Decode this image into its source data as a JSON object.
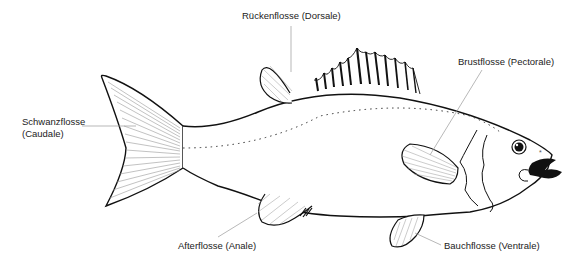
{
  "diagram": {
    "labels": {
      "dorsal": "Rückenflosse (Dorsale)",
      "pectoral": "Brustflosse (Pectorale)",
      "caudal_line1": "Schwanzflosse",
      "caudal_line2": "(Caudale)",
      "anal": "Afterflosse (Anale)",
      "ventral": "Bauchflosse (Ventrale)"
    },
    "colors": {
      "outline": "#111111",
      "ray_lines": "#888888",
      "leader_lines": "#999999",
      "background": "#ffffff"
    }
  }
}
